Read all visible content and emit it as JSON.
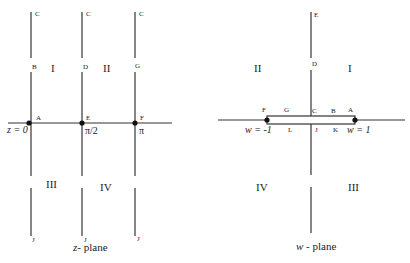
{
  "z_plane": {
    "caption_var": "z",
    "caption_rest": "- plane",
    "columns": [
      {
        "top": "C",
        "mid": "B",
        "axis": "A",
        "bottom": "J",
        "value": "z = 0"
      },
      {
        "top": "C",
        "mid": "D",
        "axis": "E",
        "bottom": "J",
        "value": "π/2"
      },
      {
        "top": "C",
        "mid": "G",
        "axis": "F",
        "bottom": "J",
        "value": "π"
      }
    ],
    "regions": [
      "I",
      "II",
      "III",
      "IV"
    ]
  },
  "w_plane": {
    "caption_var": "w",
    "caption_rest": " - plane",
    "top_label": "E",
    "mid_label": "D",
    "upper_slit_labels": [
      "F",
      "G",
      "C",
      "B",
      "A"
    ],
    "lower_slit_labels": [
      "L",
      "J",
      "K"
    ],
    "left_point_value": "w = -1",
    "right_point_value": "w = 1",
    "regions": [
      "II",
      "I",
      "IV",
      "III"
    ]
  }
}
